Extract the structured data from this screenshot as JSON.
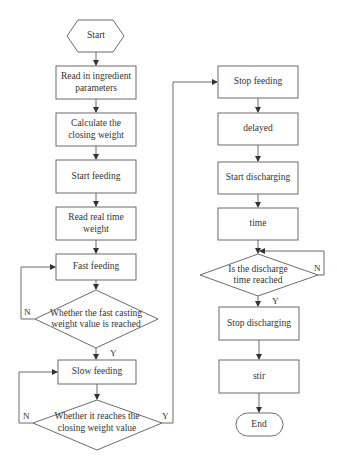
{
  "diagram": {
    "type": "flowchart",
    "left_column": {
      "start": "Start",
      "read_params": [
        "Read in ingredient",
        "parameters"
      ],
      "calc_closing": [
        "Calculate the",
        "closing weight"
      ],
      "start_feeding": "Start feeding",
      "read_weight": [
        "Read real time",
        "weight"
      ],
      "fast_feeding": "Fast feeding",
      "decision_fast": [
        "Whether the fast casting",
        "weight value is reached"
      ],
      "decision_fast_no": "N",
      "decision_fast_yes": "Y",
      "slow_feeding": "Slow feeding",
      "decision_closing": [
        "Whether it reaches the",
        "closing weight value"
      ],
      "decision_closing_no": "N",
      "decision_closing_yes": "Y"
    },
    "right_column": {
      "stop_feeding": "Stop feeding",
      "delayed": "delayed",
      "start_discharging": "Start discharging",
      "time": "time",
      "decision_discharge": [
        "Is the discharge",
        "time reached"
      ],
      "decision_discharge_no": "N",
      "decision_discharge_yes": "Y",
      "stop_discharging": "Stop discharging",
      "stir": "stir",
      "end": "End"
    },
    "colors": {
      "stroke": "#6b6b6b",
      "text": "#333333",
      "background": "#ffffff"
    }
  }
}
